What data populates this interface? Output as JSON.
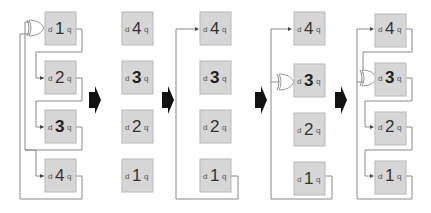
{
  "diagram": {
    "colors": {
      "box_fill": "#d6d6d6",
      "wire": "#8a8a8a",
      "arrow": "#111111"
    },
    "cell_labels": {
      "input": "d",
      "output": "q"
    },
    "stages": [
      {
        "name": "stage-1",
        "cells": [
          "1",
          "2",
          "3",
          "4"
        ],
        "bold": [
          "3"
        ],
        "xor_at": "1"
      },
      {
        "name": "stage-2",
        "cells": [
          "4",
          "3",
          "2",
          "1"
        ],
        "bold": [
          "3"
        ],
        "xor_at": null
      },
      {
        "name": "stage-3",
        "cells": [
          "4",
          "3",
          "2",
          "1"
        ],
        "bold": [
          "3"
        ],
        "xor_at": null
      },
      {
        "name": "stage-4",
        "cells": [
          "4",
          "3",
          "2",
          "1"
        ],
        "bold": [
          "3"
        ],
        "xor_at": "3"
      },
      {
        "name": "stage-5",
        "cells": [
          "4",
          "3",
          "2",
          "1"
        ],
        "bold": [
          "3"
        ],
        "xor_at": "3"
      }
    ],
    "transition_arrows": 4
  }
}
